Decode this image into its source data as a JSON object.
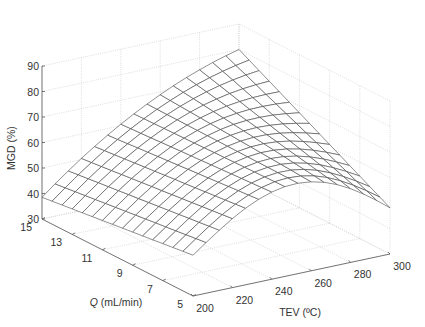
{
  "chart_data": {
    "type": "surface3d",
    "title": "",
    "xlabel": "TEV (ºC)",
    "ylabel": "Q (mL/min)",
    "ylabel_italic_part": "Q",
    "ylabel_rest": " (mL/min)",
    "zlabel": "MGD (%)",
    "x_ticks": [
      200,
      220,
      240,
      260,
      280,
      300
    ],
    "y_ticks": [
      5,
      7,
      9,
      11,
      13,
      15
    ],
    "z_ticks": [
      30,
      40,
      50,
      60,
      70,
      80,
      90
    ],
    "xlim": [
      200,
      300
    ],
    "ylim": [
      5,
      15
    ],
    "zlim": [
      30,
      90
    ],
    "grid": true,
    "mesh": {
      "rows": 15,
      "cols": 15,
      "line_color": "#444444",
      "face_color": "#ffffff"
    },
    "corner_values": [
      {
        "TEV": 200,
        "Q": 15,
        "MGD": 38.5
      },
      {
        "TEV": 300,
        "Q": 15,
        "MGD": 80
      },
      {
        "TEV": 300,
        "Q": 5,
        "MGD": 49
      },
      {
        "TEV": 200,
        "Q": 5,
        "MGD": 46
      }
    ],
    "peak": {
      "TEV": 290,
      "Q": 15,
      "MGD": 81
    }
  },
  "labels": {
    "x_axis": "TEV (ºC)",
    "y_axis_italic": "Q",
    "y_axis_rest": " (mL/min)",
    "z_axis": "MGD (%)"
  }
}
